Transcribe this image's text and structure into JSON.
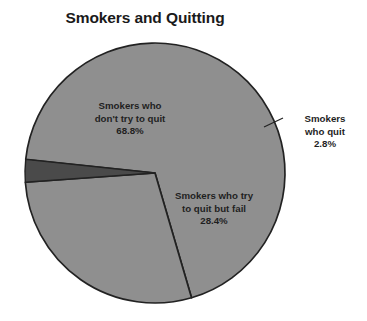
{
  "chart": {
    "title": "Smokers and Quitting",
    "background_color": "#ffffff",
    "title_color": "#1a1a1a",
    "label_color": "#1f1f1f"
  },
  "chart_data": {
    "type": "pie",
    "title": "Smokers and Quitting",
    "subtitle": "",
    "xlabel": "",
    "ylabel": "",
    "legend_position": "none",
    "grid": false,
    "value_unit": "%",
    "start_angle_deg": 186,
    "direction": "clockwise",
    "categories": [
      "Smokers who don't try to quit",
      "Smokers who try to quit but fail",
      "Smokers who quit"
    ],
    "values": [
      68.8,
      28.4,
      2.8
    ],
    "slices": [
      {
        "label_line1": "Smokers who",
        "label_line2": "don't try to quit",
        "label_line3": "",
        "percent_text": "68.8%",
        "value": 68.8,
        "color": "#8f8f8f",
        "stroke": "#222222",
        "label_placement": "inside"
      },
      {
        "label_line1": "Smokers who try",
        "label_line2": "to quit but fail",
        "label_line3": "",
        "percent_text": "28.4%",
        "value": 28.4,
        "color": "#8f8f8f",
        "stroke": "#222222",
        "label_placement": "inside"
      },
      {
        "label_line1": "Smokers",
        "label_line2": "who quit",
        "label_line3": "",
        "percent_text": "2.8%",
        "value": 2.8,
        "color": "#4a4a4a",
        "stroke": "#222222",
        "label_placement": "outside-with-leader"
      }
    ],
    "geometry": {
      "center_x": 155,
      "center_y": 173,
      "radius": 130
    }
  }
}
